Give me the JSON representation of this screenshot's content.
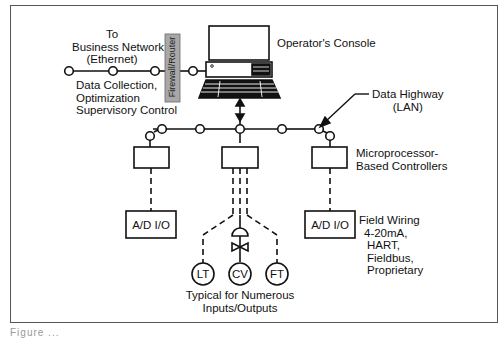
{
  "diagram": {
    "type": "Distributed Control System architecture",
    "labels": {
      "business_network": [
        "To",
        "Business Network",
        "(Ethernet)"
      ],
      "data_collection": [
        "Data Collection,",
        "Optimization",
        "Supervisory Control"
      ],
      "firewall": "Firewall/Router",
      "operators_console": "Operator's Console",
      "data_highway": [
        "Data Highway",
        "(LAN)"
      ],
      "controllers": [
        "Microprocessor-",
        "Based Controllers"
      ],
      "io_left": "A/D  I/O",
      "io_right": "A/D  I/O",
      "field_wiring": [
        "Field Wiring",
        "4-20mA,",
        "HART,",
        "Fieldbus,",
        "Proprietary"
      ],
      "instruments": [
        "LT",
        "CV",
        "FT"
      ],
      "typical": [
        "Typical for Numerous",
        "Inputs/Outputs"
      ]
    },
    "colors": {
      "line": "#111111",
      "firewall_fill": "#a8a8a8",
      "frame": "#555555",
      "background": "#ffffff"
    }
  },
  "caption": "Figure ..."
}
